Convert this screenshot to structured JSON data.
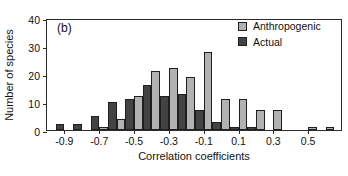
{
  "figure": {
    "panel_label": "(b)",
    "background": "#ffffff"
  },
  "colors": {
    "anthropogenic": "#b2b2b2",
    "actual": "#434343",
    "axis": "#2b2b2b",
    "text": "#111111"
  },
  "legend": {
    "position": "top-right",
    "entries": [
      {
        "label": "Anthropogenic",
        "color": "#b2b2b2",
        "swatch": "square-swatch"
      },
      {
        "label": "Actual",
        "color": "#434343",
        "swatch": "square-swatch"
      }
    ]
  },
  "chart_data": {
    "type": "bar",
    "title": "",
    "subtitle": "",
    "annotations": [
      "(b)"
    ],
    "xlabel": "Correlation coefficients",
    "ylabel": "Number of species",
    "ylim": [
      0,
      40
    ],
    "yticks": [
      0,
      10,
      20,
      30,
      40
    ],
    "ytick_labels": [
      "0",
      "10",
      "20",
      "30",
      "40"
    ],
    "xlim": [
      -1.0,
      0.7
    ],
    "xticks": [
      -0.9,
      -0.7,
      -0.5,
      -0.3,
      -0.1,
      0.1,
      0.3,
      0.5
    ],
    "xtick_labels": [
      "-0.9",
      "-0.7",
      "-0.5",
      "-0.3",
      "-0.1",
      "0.1",
      "0.3",
      "0.5"
    ],
    "grid": false,
    "bin_width": 0.1,
    "bin_starts": [
      -1.0,
      -0.9,
      -0.8,
      -0.7,
      -0.6,
      -0.5,
      -0.4,
      -0.3,
      -0.2,
      -0.1,
      0.0,
      0.1,
      0.2,
      0.3,
      0.4,
      0.5,
      0.6
    ],
    "bin_centers": [
      -0.95,
      -0.85,
      -0.75,
      -0.65,
      -0.55,
      -0.45,
      -0.35,
      -0.25,
      -0.15,
      -0.05,
      0.05,
      0.15,
      0.25,
      0.35,
      0.45,
      0.55,
      0.65
    ],
    "categories": [
      "-1.0 to -0.9",
      "-0.9 to -0.8",
      "-0.8 to -0.7",
      "-0.7 to -0.6",
      "-0.6 to -0.5",
      "-0.5 to -0.4",
      "-0.4 to -0.3",
      "-0.3 to -0.2",
      "-0.2 to -0.1",
      "-0.1 to 0.0",
      "0.0 to 0.1",
      "0.1 to 0.2",
      "0.2 to 0.3",
      "0.3 to 0.4",
      "0.4 to 0.5",
      "0.5 to 0.6",
      "0.6 to 0.7"
    ],
    "series": [
      {
        "name": "Anthropogenic",
        "color": "#b2b2b2",
        "values": [
          0,
          0,
          0,
          1,
          4,
          12,
          21,
          22,
          19,
          28,
          11,
          11,
          7,
          7,
          0,
          1,
          1
        ]
      },
      {
        "name": "Actual",
        "color": "#434343",
        "values": [
          2,
          2,
          5,
          10,
          11,
          16,
          12,
          13,
          7,
          3,
          1,
          1,
          0,
          0,
          0,
          0,
          0
        ]
      }
    ]
  }
}
